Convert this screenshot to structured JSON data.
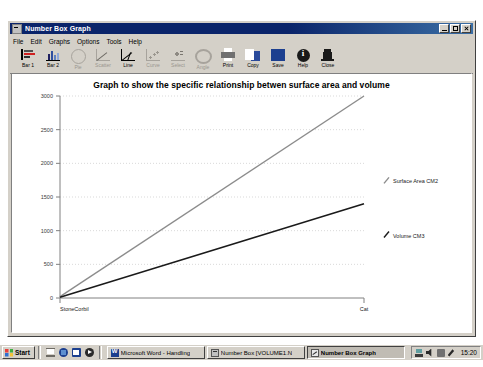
{
  "window": {
    "title": "Number Box Graph",
    "sysmenu_icon": "system-menu-icon",
    "buttons": {
      "minimize": "minimize-icon",
      "maximize": "maximize-icon",
      "close": "close-icon"
    }
  },
  "menu": {
    "items": [
      {
        "label": "File"
      },
      {
        "label": "Edit"
      },
      {
        "label": "Graphs"
      },
      {
        "label": "Options"
      },
      {
        "label": "Tools"
      },
      {
        "label": "Help"
      }
    ]
  },
  "toolbar": {
    "buttons": [
      {
        "label": "Bar 1",
        "icon": "bar-chart-1-icon",
        "enabled": true
      },
      {
        "label": "Bar 2",
        "icon": "bar-chart-2-icon",
        "enabled": true
      },
      {
        "label": "Pie",
        "icon": "pie-chart-icon",
        "enabled": false
      },
      {
        "label": "Scatter",
        "icon": "scatter-plot-icon",
        "enabled": false
      },
      {
        "label": "Line",
        "icon": "line-chart-icon",
        "enabled": true
      },
      {
        "label": "Curve",
        "icon": "curve-chart-icon",
        "enabled": false
      },
      {
        "label": "Select",
        "icon": "select-area-icon",
        "enabled": false
      },
      {
        "label": "Angle",
        "icon": "angle-gauge-icon",
        "enabled": false
      },
      {
        "label": "Print",
        "icon": "printer-icon",
        "enabled": true
      },
      {
        "label": "Copy",
        "icon": "copy-icon",
        "enabled": true
      },
      {
        "label": "Save",
        "icon": "floppy-disk-icon",
        "enabled": true
      },
      {
        "label": "Help",
        "icon": "info-icon",
        "enabled": true
      },
      {
        "label": "Close",
        "icon": "exit-door-icon",
        "enabled": true
      }
    ]
  },
  "chart_data": {
    "type": "line",
    "title": "Graph to show the specific relationship betwen surface area and volume",
    "xlabel": "",
    "ylabel": "",
    "x": [
      0,
      1
    ],
    "categories": [
      "StoneCorbil",
      "Cat"
    ],
    "series": [
      {
        "name": "Surface Area CM2",
        "values": [
          20,
          3000
        ],
        "color": "#8c8c8c"
      },
      {
        "name": "Volume CM3",
        "values": [
          10,
          1400
        ],
        "color": "#1a1a1a"
      }
    ],
    "yticks": [
      "0",
      "500",
      "1000",
      "1500",
      "2000",
      "2500",
      "3000"
    ],
    "ylim": [
      0,
      3000
    ],
    "xticklabels": [
      "StoneCorbil",
      "Cat"
    ],
    "grid": true,
    "gridstyle": "dotted-horizontal",
    "gridcolor": "#d9d9d9",
    "axiscolor": "#808080",
    "legend_position": "right",
    "legend": [
      {
        "label": "Surface Area CM2",
        "color": "#8c8c8c"
      },
      {
        "label": "Volume CM3",
        "color": "#1a1a1a"
      }
    ]
  },
  "taskbar": {
    "start_label": "Start",
    "quick_launch": [
      {
        "icon": "show-desktop-icon"
      },
      {
        "icon": "internet-explorer-icon"
      },
      {
        "icon": "outlook-express-icon"
      },
      {
        "icon": "media-player-icon"
      }
    ],
    "tasks": [
      {
        "label": "Microsoft Word - Handling",
        "icon": "word-icon",
        "active": false
      },
      {
        "label": "Number Box [VOLUME1.N",
        "icon": "app-icon",
        "active": false
      },
      {
        "label": "Number Box Graph",
        "icon": "graph-icon",
        "active": true
      }
    ],
    "tray_icons": [
      {
        "icon": "network-icon"
      },
      {
        "icon": "volume-icon"
      },
      {
        "icon": "display-icon"
      },
      {
        "icon": "pen-icon"
      }
    ],
    "clock": "15:20"
  }
}
